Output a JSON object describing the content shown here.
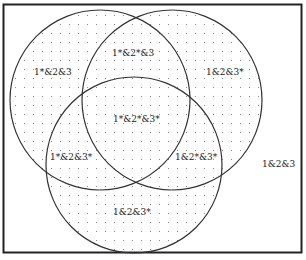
{
  "diagram": {
    "type": "venn-3",
    "style": {
      "stroke_color": "#333333",
      "dot_color": "#888888",
      "frame_color": "#222222",
      "background": "#ffffff"
    },
    "circles": [
      {
        "id": "set-1",
        "cx": 100,
        "cy": 100,
        "r": 90
      },
      {
        "id": "set-2",
        "cx": 172,
        "cy": 100,
        "r": 90
      },
      {
        "id": "set-3",
        "cx": 134,
        "cy": 165,
        "r": 88
      }
    ],
    "regions": [
      {
        "id": "only-1",
        "label": "1*&2&3",
        "x": 34,
        "y": 75
      },
      {
        "id": "1-and-2",
        "label": "1*&2*&3",
        "x": 112,
        "y": 56
      },
      {
        "id": "only-2",
        "label": "1&2&3*",
        "x": 206,
        "y": 75
      },
      {
        "id": "all-three",
        "label": "1*&2*&3*",
        "x": 113,
        "y": 122
      },
      {
        "id": "1-and-3",
        "label": "1*&2&3*",
        "x": 50,
        "y": 160
      },
      {
        "id": "2-and-3",
        "label": "1&2*&3*",
        "x": 175,
        "y": 160
      },
      {
        "id": "only-3",
        "label": "1&2&3*",
        "x": 113,
        "y": 215
      },
      {
        "id": "outside",
        "label": "1&2&3",
        "x": 262,
        "y": 167
      }
    ]
  }
}
